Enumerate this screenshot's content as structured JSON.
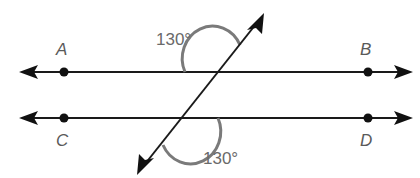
{
  "figure": {
    "type": "parallel-lines-cut-by-transversal",
    "lines": [
      {
        "name": "AB",
        "points": [
          "A",
          "B"
        ]
      },
      {
        "name": "CD",
        "points": [
          "C",
          "D"
        ]
      }
    ],
    "point_labels": {
      "A": "A",
      "B": "B",
      "C": "C",
      "D": "D"
    },
    "angles": [
      {
        "position": "upper-left-above-AB",
        "label": "130°"
      },
      {
        "position": "lower-right-below-CD",
        "label": "130°"
      }
    ],
    "colors": {
      "line": "#1a1a1a",
      "arc": "#7a7a7a",
      "label": "#5a5a5a"
    }
  }
}
